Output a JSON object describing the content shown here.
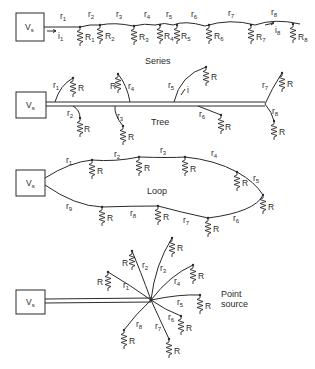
{
  "colors": {
    "ink": "#2a2a2a",
    "background": "#ffffff"
  },
  "source_label": "V",
  "source_sub": "s",
  "panels": {
    "series": {
      "caption": "Series",
      "segments": [
        "1",
        "2",
        "3",
        "4",
        "5",
        "6",
        "7",
        "8"
      ],
      "resistors": [
        "1",
        "2",
        "3",
        "4",
        "5",
        "6",
        "7",
        "8"
      ],
      "currents": [
        "1",
        "8"
      ]
    },
    "tree": {
      "caption": "Tree",
      "branches": [
        "1",
        "2",
        "3",
        "4",
        "5",
        "6",
        "7",
        "8"
      ],
      "current": "i",
      "load_label": "R"
    },
    "loop": {
      "caption": "Loop",
      "segments": [
        "1",
        "2",
        "3",
        "4",
        "5",
        "6",
        "7",
        "8",
        "9"
      ],
      "load_label": "R"
    },
    "point_source": {
      "caption_line1": "Point",
      "caption_line2": "source",
      "branches": [
        "1",
        "2",
        "3",
        "4",
        "5",
        "6",
        "7",
        "8"
      ],
      "load_label": "R"
    }
  },
  "glyphs": {
    "r": "r",
    "R": "R",
    "i": "i"
  }
}
